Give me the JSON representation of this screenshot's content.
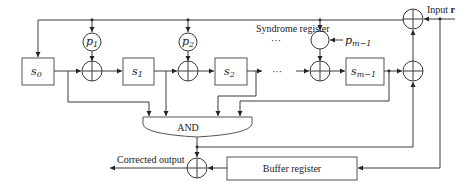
{
  "diagram": {
    "title_label": "Syndrome register",
    "input_label": "Input",
    "input_symbol": "r",
    "and_label": "AND",
    "output_label": "Corrected output",
    "buffer_label": "Buffer register",
    "ellipsis": "···",
    "registers": [
      {
        "base": "s",
        "sub": "0"
      },
      {
        "base": "s",
        "sub": "1"
      },
      {
        "base": "s",
        "sub": "2"
      },
      {
        "base": "s",
        "sub": "m−1"
      }
    ],
    "coefficients": [
      {
        "base": "p",
        "sub": "1"
      },
      {
        "base": "p",
        "sub": "2"
      },
      {
        "base": "p",
        "sub": "m−1"
      }
    ],
    "colors": {
      "line": "#3a3a3a",
      "box_border": "#555555",
      "background": "#ffffff"
    }
  }
}
